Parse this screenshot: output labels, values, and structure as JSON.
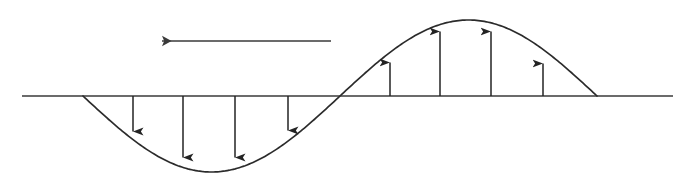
{
  "figure": {
    "width": 686,
    "height": 187,
    "background_color": "#ffffff",
    "stroke_color": "#2b2b2b",
    "baseline_color": "#3a3a3a",
    "arrow_color": "#232323"
  },
  "chart_data": {
    "type": "line",
    "title": "",
    "xlabel": "",
    "ylabel": "",
    "grid": false,
    "legend": null,
    "xlim": [
      0,
      686
    ],
    "ylim": [
      187,
      0
    ],
    "baseline_y": 96,
    "curve": {
      "name": "sine-wave",
      "description": "one full sine cycle, trough first then crest",
      "x_start": 83,
      "x_end": 597,
      "zero_crossing_x": 340,
      "trough_x": 211,
      "trough_y": 172,
      "crest_x": 468,
      "crest_y": 17,
      "amplitude_px": 76
    },
    "baseline": {
      "x_start": 22,
      "x_end": 673,
      "y": 96
    },
    "vectors": [
      {
        "label": "v1",
        "direction": "down",
        "x": 133,
        "y_tail": 96,
        "y_tip": 142
      },
      {
        "label": "v2",
        "direction": "down",
        "x": 183,
        "y_tail": 96,
        "y_tip": 168
      },
      {
        "label": "v3",
        "direction": "down",
        "x": 235,
        "y_tail": 96,
        "y_tip": 168
      },
      {
        "label": "v4",
        "direction": "down",
        "x": 288,
        "y_tail": 96,
        "y_tip": 141
      },
      {
        "label": "v5",
        "direction": "up",
        "x": 390,
        "y_tail": 96,
        "y_tip": 52
      },
      {
        "label": "v6",
        "direction": "up",
        "x": 440,
        "y_tail": 96,
        "y_tip": 21
      },
      {
        "label": "v7",
        "direction": "up",
        "x": 491,
        "y_tail": 96,
        "y_tip": 21
      },
      {
        "label": "v8",
        "direction": "up",
        "x": 543,
        "y_tail": 96,
        "y_tip": 53
      }
    ],
    "annotations": [
      {
        "name": "propagation-direction-arrow",
        "kind": "arrow",
        "direction": "left",
        "x_tip": 152,
        "x_tail": 331,
        "y": 41,
        "text": ""
      }
    ]
  }
}
